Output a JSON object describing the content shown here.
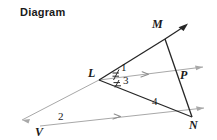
{
  "figure": {
    "title": "Diagram",
    "colors": {
      "solid_line": "#262626",
      "ray_line": "#a8a8a8",
      "text": "#1a1a1a",
      "background": "#ffffff"
    },
    "vertices": [
      {
        "id": "L",
        "label": "L",
        "x": 99,
        "y": 80,
        "label_x": 88,
        "label_y": 73
      },
      {
        "id": "M",
        "label": "M",
        "x": 165,
        "y": 39,
        "label_x": 153,
        "label_y": 24
      },
      {
        "id": "N",
        "label": "N",
        "x": 192,
        "y": 117,
        "label_x": 191,
        "label_y": 117
      },
      {
        "id": "P",
        "label": "P",
        "x": 180,
        "y": 77,
        "label_x": 181,
        "label_y": 70
      },
      {
        "id": "V",
        "label": "V",
        "x": 40,
        "y": 126,
        "label_x": 36,
        "label_y": 126
      }
    ],
    "angle_labels": [
      {
        "id": "angle-1",
        "label": "1",
        "x": 122,
        "y": 67
      },
      {
        "id": "angle-3",
        "label": "3",
        "x": 124,
        "y": 80
      },
      {
        "id": "angle-4",
        "label": "4",
        "x": 154,
        "y": 101
      },
      {
        "id": "angle-2",
        "label": "2",
        "x": 60,
        "y": 116
      }
    ],
    "segments": [
      {
        "id": "segment-LM",
        "from": "L",
        "to": "M",
        "style": "solid"
      },
      {
        "id": "segment-MN",
        "from": "M",
        "to": "N",
        "style": "solid"
      },
      {
        "id": "segment-LN",
        "from": "L",
        "to": "N",
        "style": "solid"
      }
    ],
    "rays": [
      {
        "id": "ray-LM-extended",
        "style": "solid",
        "arrow": "dark",
        "x1": 165,
        "y1": 39,
        "x2": 188,
        "y2": 24
      },
      {
        "id": "ray-L-to-P",
        "style": "light",
        "arrow": "gray",
        "x1": 99,
        "y1": 80,
        "x2": 207,
        "y2": 66,
        "tick": {
          "x": 146,
          "y": 74
        }
      },
      {
        "id": "ray-V-to-N",
        "style": "light",
        "arrow": "gray",
        "x1": 40,
        "y1": 126,
        "x2": 209,
        "y2": 108,
        "tick": {
          "x": 118,
          "y": 117
        }
      },
      {
        "id": "ray-L-through-V",
        "style": "light",
        "arrow": "gray",
        "x1": 99,
        "y1": 80,
        "x2": 17,
        "y2": 123
      }
    ],
    "angle_marks": {
      "description": "congruence tick marks on angles 1 and 3 at vertex L",
      "count": 2
    }
  }
}
